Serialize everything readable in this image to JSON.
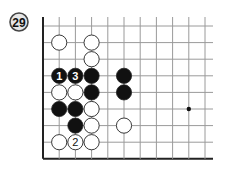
{
  "problem": {
    "number": "29",
    "badge_fill": "#e6e6e6",
    "badge_stroke": "#444444"
  },
  "board": {
    "origin_x": 43,
    "origin_y": 26,
    "dx": 16.2,
    "dy": 16.6,
    "cols": 11,
    "rows": 9,
    "h_line_extend_right": 213,
    "v_line_top": 17,
    "line_color": "#9a9a9a",
    "edge_color": "#222222",
    "stone_radius": 7.6,
    "left_edge": true,
    "bottom_edge": true,
    "star_points": [
      [
        9,
        5
      ]
    ],
    "stones": [
      {
        "col": 1,
        "row": 1,
        "color": "white",
        "label": ""
      },
      {
        "col": 3,
        "row": 1,
        "color": "white",
        "label": ""
      },
      {
        "col": 3,
        "row": 2,
        "color": "white",
        "label": ""
      },
      {
        "col": 1,
        "row": 3,
        "color": "black",
        "label": "1"
      },
      {
        "col": 2,
        "row": 3,
        "color": "black",
        "label": "3"
      },
      {
        "col": 3,
        "row": 3,
        "color": "black",
        "label": ""
      },
      {
        "col": 5,
        "row": 3,
        "color": "black",
        "label": ""
      },
      {
        "col": 1,
        "row": 4,
        "color": "white",
        "label": ""
      },
      {
        "col": 2,
        "row": 4,
        "color": "white",
        "label": ""
      },
      {
        "col": 3,
        "row": 4,
        "color": "black",
        "label": ""
      },
      {
        "col": 5,
        "row": 4,
        "color": "black",
        "label": ""
      },
      {
        "col": 1,
        "row": 5,
        "color": "black",
        "label": ""
      },
      {
        "col": 2,
        "row": 5,
        "color": "black",
        "label": ""
      },
      {
        "col": 3,
        "row": 5,
        "color": "white",
        "label": ""
      },
      {
        "col": 2,
        "row": 6,
        "color": "black",
        "label": ""
      },
      {
        "col": 3,
        "row": 6,
        "color": "white",
        "label": ""
      },
      {
        "col": 5,
        "row": 6,
        "color": "white",
        "label": ""
      },
      {
        "col": 1,
        "row": 7,
        "color": "white",
        "label": ""
      },
      {
        "col": 2,
        "row": 7,
        "color": "white",
        "label": "2"
      },
      {
        "col": 3,
        "row": 7,
        "color": "white",
        "label": ""
      }
    ]
  }
}
